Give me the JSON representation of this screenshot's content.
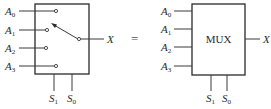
{
  "diagram": {
    "left": {
      "inputs": [
        {
          "base": "A",
          "sub": "0"
        },
        {
          "base": "A",
          "sub": "1"
        },
        {
          "base": "A",
          "sub": "2"
        },
        {
          "base": "A",
          "sub": "3"
        }
      ],
      "selects": [
        {
          "base": "S",
          "sub": "1"
        },
        {
          "base": "S",
          "sub": "0"
        }
      ],
      "output": "X"
    },
    "equals": "=",
    "right": {
      "block_label": "MUX",
      "inputs": [
        {
          "base": "A",
          "sub": "0"
        },
        {
          "base": "A",
          "sub": "1"
        },
        {
          "base": "A",
          "sub": "2"
        },
        {
          "base": "A",
          "sub": "3"
        }
      ],
      "selects": [
        {
          "base": "S",
          "sub": "1"
        },
        {
          "base": "S",
          "sub": "0"
        }
      ],
      "output": "X"
    },
    "colors": {
      "line": "#2a2a2a",
      "background": "#ffffff"
    }
  }
}
